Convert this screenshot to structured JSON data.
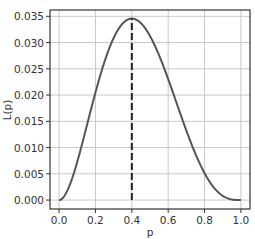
{
  "chart_data": {
    "type": "line",
    "title": "",
    "xlabel": "p",
    "ylabel": "L(p)",
    "xlim": [
      -0.05,
      1.05
    ],
    "ylim": [
      -0.0017,
      0.0362
    ],
    "grid": true,
    "legend": null,
    "x_ticks": [
      "0.0",
      "0.2",
      "0.4",
      "0.6",
      "0.8",
      "1.0"
    ],
    "y_ticks": [
      "0.000",
      "0.005",
      "0.010",
      "0.015",
      "0.020",
      "0.025",
      "0.030",
      "0.035"
    ],
    "series": [
      {
        "name": "L(p) = p^2 (1-p)^3",
        "style": "solid",
        "color": "#555555",
        "x": [
          0.0,
          0.05,
          0.1,
          0.15,
          0.2,
          0.25,
          0.3,
          0.35,
          0.4,
          0.45,
          0.5,
          0.55,
          0.6,
          0.65,
          0.7,
          0.75,
          0.8,
          0.85,
          0.9,
          0.95,
          1.0
        ],
        "values": [
          0.0,
          0.00214,
          0.00729,
          0.01382,
          0.02048,
          0.02637,
          0.03087,
          0.03364,
          0.03456,
          0.03369,
          0.03125,
          0.02756,
          0.02304,
          0.01811,
          0.01323,
          0.00879,
          0.00512,
          0.00244,
          0.00081,
          0.00011,
          0.0
        ]
      }
    ],
    "annotations": [
      {
        "type": "vertical-dashed-line",
        "x": 0.4,
        "y_from": 0.0,
        "y_to": 0.03456,
        "color": "#222222",
        "label": "maximum at p = 0.4"
      }
    ]
  },
  "colors": {
    "curve": "#555555",
    "dashed": "#222222",
    "grid": "#c8c8c8",
    "frame": "#333333"
  }
}
